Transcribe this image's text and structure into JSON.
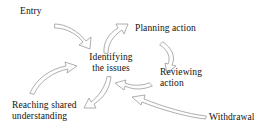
{
  "diagram": {
    "type": "cycle-flow",
    "background_color": "#ffffff",
    "text_color": "#111111",
    "arrow_outline_color": "#9a9a9a",
    "arrow_fill_color": "#fdfdfd",
    "nodes": [
      {
        "id": "entry",
        "label": "Entry",
        "x": 20,
        "y": 6,
        "align": "left"
      },
      {
        "id": "planning",
        "label": "Planning action",
        "x": 135,
        "y": 23,
        "align": "left"
      },
      {
        "id": "identifying",
        "label_line1": "Identifying",
        "label_line2": "the issues",
        "x": 88,
        "y": 52,
        "align": "center"
      },
      {
        "id": "reviewing",
        "label_line1": "Reviewing",
        "label_line2": "action",
        "x": 160,
        "y": 67,
        "align": "left"
      },
      {
        "id": "reaching",
        "label_line1": "Reaching shared",
        "label_line2": "understanding",
        "x": 12,
        "y": 100,
        "align": "left"
      },
      {
        "id": "withdrawal",
        "label": "Withdrawal",
        "x": 209,
        "y": 112,
        "align": "left"
      }
    ],
    "edges": [
      {
        "id": "entry-to-identifying",
        "from": "entry",
        "to": "identifying",
        "direction": "down-right"
      },
      {
        "id": "identifying-to-planning",
        "from": "identifying",
        "to": "planning",
        "direction": "up-right"
      },
      {
        "id": "planning-to-reviewing",
        "from": "planning",
        "to": "reviewing",
        "direction": "down"
      },
      {
        "id": "reviewing-to-identifying",
        "from": "reviewing",
        "to": "identifying",
        "direction": "up-left"
      },
      {
        "id": "identifying-to-reaching",
        "from": "identifying",
        "to": "reaching",
        "direction": "down-left"
      },
      {
        "id": "reaching-to-identifying",
        "from": "reaching",
        "to": "identifying",
        "direction": "up-right"
      },
      {
        "id": "withdrawal-to-cycle",
        "from": "withdrawal",
        "to": "identifying",
        "direction": "left"
      }
    ]
  }
}
